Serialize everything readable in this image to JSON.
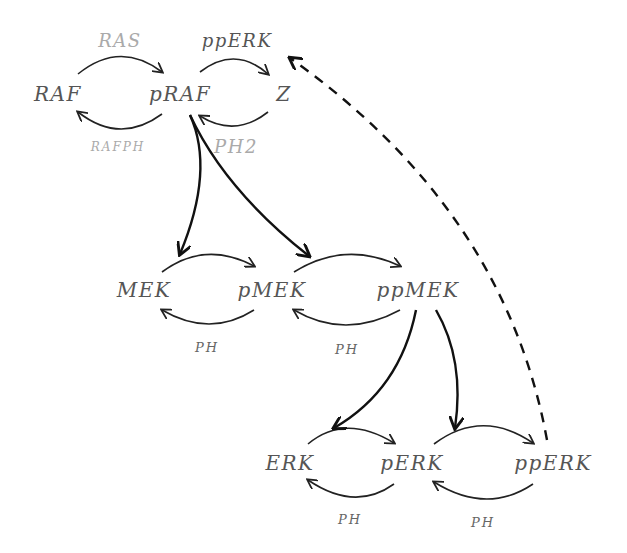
{
  "diagram": {
    "type": "MAPK cascade",
    "tier1": {
      "species": [
        "RAF",
        "pRAF",
        "Z"
      ],
      "enzymes": {
        "raf_forward": "RAS",
        "raf_reverse": "RAFPH",
        "z_forward": "ppERK",
        "z_reverse": "PH2"
      }
    },
    "tier2": {
      "species": [
        "MEK",
        "pMEK",
        "ppMEK"
      ],
      "enzymes": {
        "reverse1": "PH",
        "reverse2": "PH"
      }
    },
    "tier3": {
      "species": [
        "ERK",
        "pERK",
        "ppERK"
      ],
      "enzymes": {
        "reverse1": "PH",
        "reverse2": "PH"
      }
    },
    "edges": [
      {
        "from": "pRAF",
        "to": "MEK->pMEK",
        "style": "solid"
      },
      {
        "from": "pRAF",
        "to": "pMEK->ppMEK",
        "style": "solid"
      },
      {
        "from": "ppMEK",
        "to": "ERK->pERK",
        "style": "solid"
      },
      {
        "from": "ppMEK",
        "to": "pERK->ppERK",
        "style": "solid"
      },
      {
        "from": "ppERK",
        "to": "pRAF->Z",
        "style": "dashed"
      }
    ]
  }
}
